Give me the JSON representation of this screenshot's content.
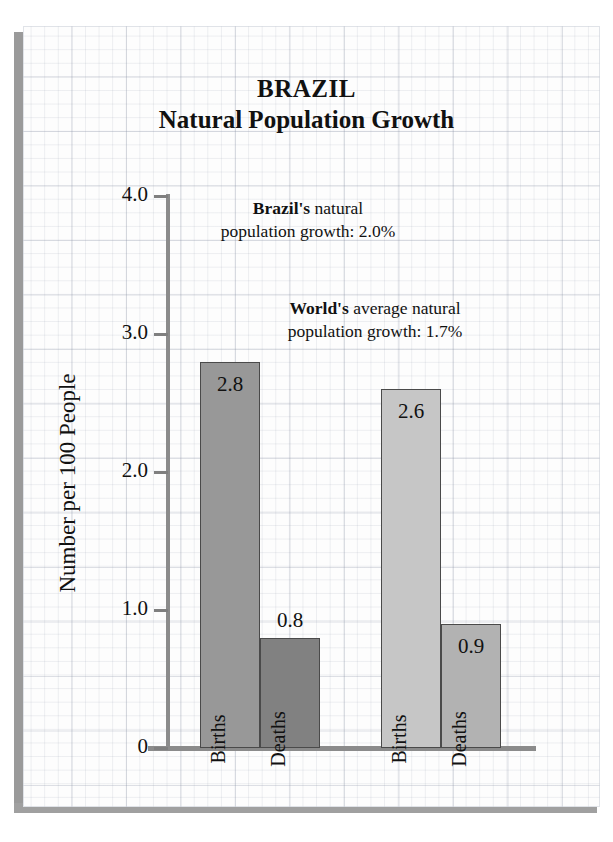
{
  "title": {
    "line1": "BRAZIL",
    "line2": "Natural Population Growth"
  },
  "annotations": {
    "brazil": {
      "bold": "Brazil's",
      "rest_line1": " natural",
      "line2": "population growth:  2.0%"
    },
    "world": {
      "bold": "World's",
      "rest_line1": " average natural",
      "line2": "population growth:  1.7%"
    }
  },
  "axis": {
    "y_title": "Number per 100 People",
    "y_ticks": [
      "4.0",
      "3.0",
      "2.0",
      "1.0",
      "0"
    ]
  },
  "bars": [
    {
      "group": "Brazil",
      "series": "Births",
      "label": "Births",
      "value": "2.8",
      "color": "#989898"
    },
    {
      "group": "Brazil",
      "series": "Deaths",
      "label": "Deaths",
      "value": "0.8",
      "color": "#818181"
    },
    {
      "group": "World",
      "series": "Births",
      "label": "Births",
      "value": "2.6",
      "color": "#c6c6c6"
    },
    {
      "group": "World",
      "series": "Deaths",
      "label": "Deaths",
      "value": "0.9",
      "color": "#b2b2b2"
    }
  ],
  "chart_data": {
    "type": "bar",
    "title": "BRAZIL Natural Population Growth",
    "xlabel": "",
    "ylabel": "Number per 100 People",
    "ylim": [
      0,
      4.0
    ],
    "yticks": [
      0,
      1.0,
      2.0,
      3.0,
      4.0
    ],
    "grid": true,
    "legend": "none",
    "categories": [
      "Brazil",
      "World"
    ],
    "series": [
      {
        "name": "Births",
        "values": [
          2.8,
          2.6
        ]
      },
      {
        "name": "Deaths",
        "values": [
          0.8,
          0.9
        ]
      }
    ],
    "annotations": [
      "Brazil's natural population growth:  2.0%",
      "World's average natural population growth:  1.7%"
    ]
  }
}
